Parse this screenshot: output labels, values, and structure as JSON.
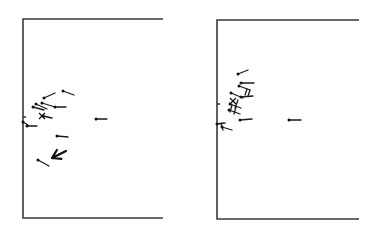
{
  "figure": {
    "panels": [
      {
        "id": "left",
        "frame": {
          "left": 23,
          "top": 19,
          "right": 163,
          "bottom": 218,
          "axis_tick_y": 117
        },
        "vectors": [
          {
            "x1": 63,
            "y1": 91,
            "x2": 74,
            "y2": 95
          },
          {
            "x1": 44,
            "y1": 98,
            "x2": 55,
            "y2": 93
          },
          {
            "x1": 42,
            "y1": 103,
            "x2": 55,
            "y2": 107
          },
          {
            "x1": 36,
            "y1": 104,
            "x2": 47,
            "y2": 109
          },
          {
            "x1": 33,
            "y1": 107,
            "x2": 44,
            "y2": 110
          },
          {
            "x1": 55,
            "y1": 107,
            "x2": 66,
            "y2": 107
          },
          {
            "x1": 43,
            "y1": 116,
            "x2": 52,
            "y2": 118
          },
          {
            "x1": 23,
            "y1": 122,
            "x2": 28,
            "y2": 125
          },
          {
            "x1": 27,
            "y1": 126,
            "x2": 37,
            "y2": 126
          },
          {
            "x1": 57,
            "y1": 136,
            "x2": 68,
            "y2": 137
          },
          {
            "x1": 38,
            "y1": 160,
            "x2": 49,
            "y2": 166
          },
          {
            "x1": 96,
            "y1": 119,
            "x2": 107,
            "y2": 119
          }
        ],
        "crosses": [
          {
            "x": 42,
            "y": 116
          }
        ],
        "arrows": [
          {
            "x1": 66,
            "y1": 151,
            "x2": 52,
            "y2": 158
          }
        ]
      },
      {
        "id": "right",
        "frame": {
          "left": 217,
          "top": 20,
          "right": 359,
          "bottom": 219,
          "axis_tick_y": 104
        },
        "vectors": [
          {
            "x1": 238,
            "y1": 74,
            "x2": 248,
            "y2": 70
          },
          {
            "x1": 241,
            "y1": 83,
            "x2": 254,
            "y2": 83
          },
          {
            "x1": 239,
            "y1": 86,
            "x2": 250,
            "y2": 90
          },
          {
            "x1": 231,
            "y1": 93,
            "x2": 243,
            "y2": 98
          },
          {
            "x1": 241,
            "y1": 97,
            "x2": 253,
            "y2": 96
          },
          {
            "x1": 230,
            "y1": 104,
            "x2": 241,
            "y2": 108
          },
          {
            "x1": 229,
            "y1": 110,
            "x2": 240,
            "y2": 114
          },
          {
            "x1": 240,
            "y1": 120,
            "x2": 252,
            "y2": 119
          },
          {
            "x1": 217,
            "y1": 124,
            "x2": 225,
            "y2": 123
          },
          {
            "x1": 222,
            "y1": 127,
            "x2": 232,
            "y2": 130
          },
          {
            "x1": 289,
            "y1": 120,
            "x2": 301,
            "y2": 120
          }
        ],
        "slashes": [
          {
            "x1": 247,
            "y1": 89,
            "x2": 245,
            "y2": 95
          },
          {
            "x1": 250,
            "y1": 90,
            "x2": 248,
            "y2": 96
          },
          {
            "x1": 238,
            "y1": 100,
            "x2": 235,
            "y2": 108
          },
          {
            "x1": 232,
            "y1": 105,
            "x2": 230,
            "y2": 112
          },
          {
            "x1": 236,
            "y1": 107,
            "x2": 234,
            "y2": 114
          },
          {
            "x1": 221,
            "y1": 123,
            "x2": 223,
            "y2": 130
          }
        ],
        "crosses": [
          {
            "x": 233,
            "y": 101
          }
        ]
      }
    ],
    "colors": {
      "ink": "#111111",
      "frame": "#3a3a3a",
      "background": "#ffffff"
    }
  }
}
